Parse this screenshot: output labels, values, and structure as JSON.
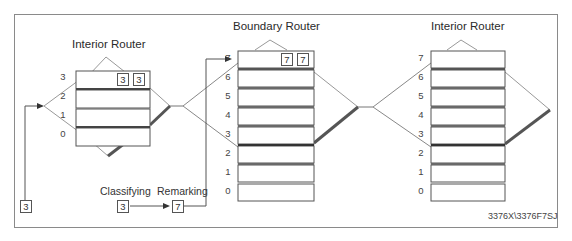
{
  "diagram": {
    "routers": [
      {
        "name": "Interior Router",
        "position": "left",
        "queues": [
          "3",
          "2",
          "1",
          "0"
        ],
        "packets_in_top_queue": [
          "3",
          "3"
        ]
      },
      {
        "name": "Boundary Router",
        "position": "center",
        "queues": [
          "7",
          "6",
          "5",
          "4",
          "3",
          "2",
          "1",
          "0"
        ],
        "packets_in_top_queue": [
          "7",
          "7"
        ]
      },
      {
        "name": "Interior Router",
        "position": "right",
        "queues": [
          "7",
          "6",
          "5",
          "4",
          "3",
          "2",
          "1",
          "0"
        ],
        "packets_in_top_queue": []
      }
    ],
    "incoming_packet": "3",
    "classifying": {
      "label": "Classifying",
      "value": "3"
    },
    "remarking": {
      "label": "Remarking",
      "value": "7"
    },
    "figure_code": "3376X\\3376F7SJ"
  },
  "colors": {
    "frame": "#8a8a8a",
    "line": "#555555",
    "thin_line": "#999999",
    "thick_link": "#555555"
  }
}
